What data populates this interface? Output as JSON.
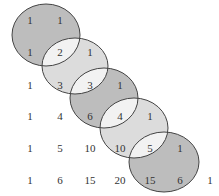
{
  "diagram": {
    "title": "",
    "rows": [
      [
        "1",
        "1"
      ],
      [
        "1",
        "2",
        "1"
      ],
      [
        "1",
        "3",
        "3",
        "1"
      ],
      [
        "1",
        "4",
        "6",
        "4",
        "1"
      ],
      [
        "1",
        "5",
        "10",
        "10",
        "5",
        "1"
      ],
      [
        "1",
        "6",
        "15",
        "20",
        "15",
        "6",
        "1"
      ]
    ],
    "ellipses": [
      {
        "cx": 46,
        "cy": 35,
        "rx": 34,
        "ry": 31,
        "fill": "#bdbdbd"
      },
      {
        "cx": 75,
        "cy": 66,
        "rx": 33,
        "ry": 28,
        "fill": "#dcdcdc"
      },
      {
        "cx": 104,
        "cy": 98,
        "rx": 34,
        "ry": 30,
        "fill": "#bdbdbd"
      },
      {
        "cx": 134,
        "cy": 128,
        "rx": 34,
        "ry": 30,
        "fill": "#dcdcdc"
      },
      {
        "cx": 164,
        "cy": 162,
        "rx": 35,
        "ry": 30,
        "fill": "#bdbdbd"
      }
    ],
    "colors": {
      "stroke": "#444444",
      "overlap": "#f2f2f2",
      "text": "#333333"
    }
  }
}
